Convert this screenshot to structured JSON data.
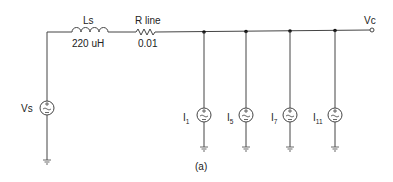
{
  "circuit": {
    "caption": "(a)",
    "source": {
      "label": "Vs",
      "type": "ac-voltage-source"
    },
    "inductor": {
      "label": "Ls",
      "value": "220 uH"
    },
    "resistor": {
      "label": "R line",
      "value": "0.01"
    },
    "output_node": {
      "label": "Vc"
    },
    "current_sources": [
      {
        "base": "I",
        "sub": "1"
      },
      {
        "base": "I",
        "sub": "5"
      },
      {
        "base": "I",
        "sub": "7"
      },
      {
        "base": "I",
        "sub": "11"
      }
    ]
  },
  "colors": {
    "line": "#444444",
    "text": "#222222",
    "background": "#ffffff"
  }
}
